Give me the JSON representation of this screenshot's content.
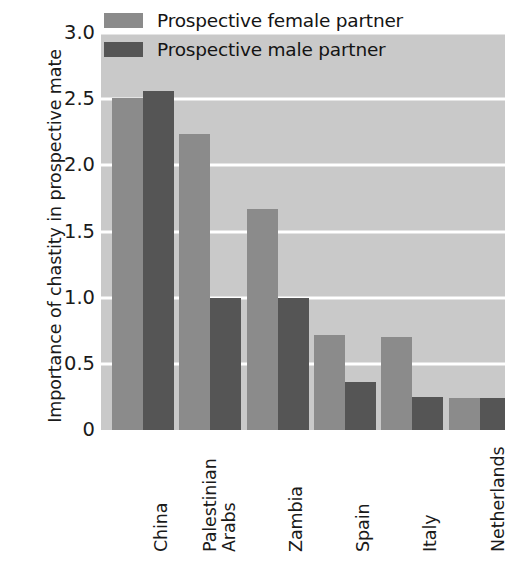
{
  "chart_data": {
    "type": "bar",
    "title": "",
    "xlabel": "",
    "ylabel": "Importance of chastity in prospective mate",
    "categories": [
      "China",
      "Palestinian Arabs",
      "Zambia",
      "Spain",
      "Italy",
      "Netherlands"
    ],
    "category_lines": [
      [
        "China"
      ],
      [
        "Palestinian",
        "Arabs"
      ],
      [
        "Zambia"
      ],
      [
        "Spain"
      ],
      [
        "Italy"
      ],
      [
        "Netherlands"
      ]
    ],
    "series": [
      {
        "name": "Prospective female partner",
        "color": "#8b8b8b",
        "values": [
          2.51,
          2.24,
          1.67,
          0.72,
          0.7,
          0.24
        ]
      },
      {
        "name": "Prospective male partner",
        "color": "#555555",
        "values": [
          2.56,
          1.0,
          1.0,
          0.36,
          0.25,
          0.24
        ]
      }
    ],
    "ylim": [
      0,
      3.0
    ],
    "yticks": [
      0,
      0.5,
      1.0,
      1.5,
      2.0,
      2.5,
      3.0
    ],
    "ytick_labels": [
      "0",
      "0.5",
      "1.0",
      "1.5",
      "2.0",
      "2.5",
      "3.0"
    ],
    "gridlines": [
      0.5,
      1.0,
      1.5,
      2.0,
      2.5,
      3.0
    ],
    "grid": true,
    "legend_position": "top-center",
    "plot_background": "#c9c9c9",
    "grid_color": "#ffffff",
    "figure_background": "#ffffff"
  },
  "legend": {
    "entries": [
      {
        "label": "Prospective female partner",
        "swatch": "female"
      },
      {
        "label": "Prospective male partner",
        "swatch": "male"
      }
    ]
  }
}
